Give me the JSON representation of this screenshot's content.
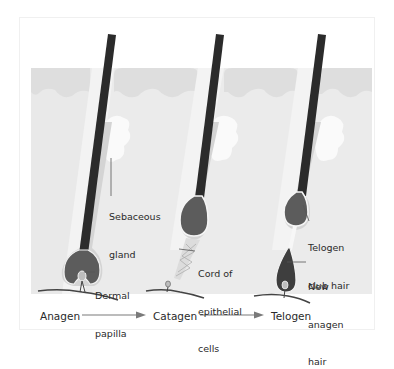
{
  "diagram": {
    "colors": {
      "skin_light": "#ebebeb",
      "skin_surface": "#e0e0e0",
      "sebaceous": "#fafafa",
      "hair_shaft": "#2b2b2b",
      "bulb": "#5c5c5c",
      "sheath": "#d4d4d4",
      "arrow": "#7a7a7a",
      "text": "#2a2a2a"
    },
    "labels": {
      "sebaceous_gland_line1": "Sebaceous",
      "sebaceous_gland_line2": "gland",
      "dermal_papilla_line1": "Dermal",
      "dermal_papilla_line2": "papilla",
      "cord_line1": "Cord of",
      "cord_line2": "epithelial",
      "cord_line3": "cells",
      "telogen_club_line1": "Telogen",
      "telogen_club_line2": "club hair",
      "new_anagen_line1": "New",
      "new_anagen_line2": "anagen",
      "new_anagen_line3": "hair"
    },
    "stages": [
      {
        "label": "Anagen"
      },
      {
        "label": "Catagen"
      },
      {
        "label": "Telogen"
      }
    ]
  }
}
